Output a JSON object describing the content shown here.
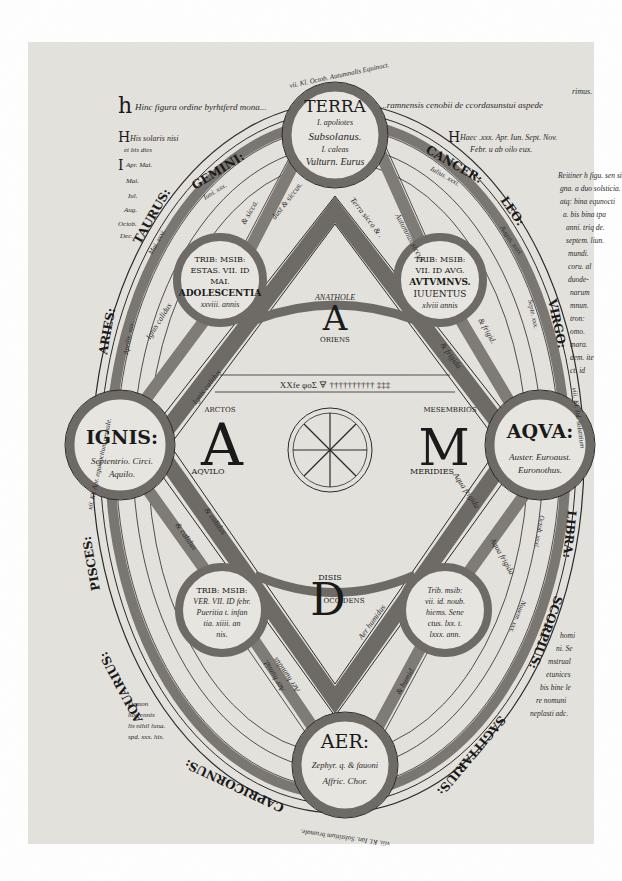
{
  "diagram": {
    "colors": {
      "parchment": "#e4e2dd",
      "ink": "#1a1a1a",
      "band_dark": "#6e6a66",
      "band_mid": "#9a9692",
      "band_light": "#c9c6c1",
      "margin": "#ffffff"
    },
    "header": {
      "line1": "Hinc figura ordine byrhtferd mona...",
      "line1_cont": "...ramnensis cenobii de ccordasunstui aspede",
      "corner_note": "rimus.",
      "right_line": "Haec .xxx. Apr. Iun. Sept. Nov.",
      "right_line2": "Febr. u ab oilo eux.",
      "left_lines": [
        "His solaris nisi",
        "et bis dies",
        "Apr. Mai.",
        "Mai.",
        "Iul.",
        "Aug.",
        "Octob.",
        "Dec."
      ]
    },
    "elements": {
      "terra": {
        "title": "TERRA",
        "lines": [
          "I. apoliotes",
          "Subsolanus.",
          "I. caleas",
          "Vulturn. Eurus"
        ]
      },
      "ignis": {
        "title": "IGNIS:",
        "lines": [
          "Septentrio. Circi.",
          "Aquilo."
        ]
      },
      "aqua": {
        "title": "AQVA:",
        "lines": [
          "Auster. Euroaust.",
          "Euronothus."
        ]
      },
      "aer": {
        "title": "AER:",
        "lines": [
          "Zephyr. q. & fauoni",
          "Affric. Chor."
        ]
      }
    },
    "seasons": {
      "summer": {
        "lines": [
          "TRIB: MSIB:",
          "ESTAS. VII. ID",
          "MAI.",
          "ADOLESCENTIA",
          "xxviii. annis"
        ]
      },
      "autumn": {
        "lines": [
          "TRIB: MSIB:",
          "VII. ID AVG.",
          "AVTVMNVS.",
          "IUUENTUS",
          "xlviii annis"
        ]
      },
      "spring": {
        "lines": [
          "TRIB: MSIB:",
          "VER. VII. ID febr.",
          "Pueritia t. infan",
          "tia. xiiii. an",
          "nis."
        ]
      },
      "winter": {
        "lines": [
          "Trib. msib:",
          "vii. id. noub.",
          "hiems. Sene",
          "ctus. lxx. t.",
          "lxxx. ann."
        ]
      }
    },
    "zodiac": {
      "left": [
        "GEMINI:",
        "TAURUS:",
        "ARIES:",
        "PISCES:",
        "AQUARIUS:",
        "CAPRICORNUS:"
      ],
      "right": [
        "CANCER:",
        "LEO:",
        "VIRGO:",
        "LIBRA:",
        "SCORPIUS:",
        "SAGITTARIUS:"
      ],
      "month_notes": {
        "gemini": [
          "Iuni. xxx.",
          "Iu. xxx."
        ],
        "taurus": [
          "Mai. xxxi.",
          "Iu. xxx."
        ],
        "aries": [
          "Aprilis. xxx.",
          "Iu. xxix."
        ],
        "cancer": [
          "Iulius. xxxi.",
          "Iu. xxix."
        ],
        "leo": [
          "Augus. xxxi.",
          "Iu. xxx."
        ],
        "virgo": [
          "Septe. xxx.",
          "Iu. xxx."
        ],
        "libra": [
          "Octob. xxxi.",
          "Iu. xxix."
        ],
        "scorpius": [
          "Nouem. xxx.",
          "Iu. xxx."
        ]
      },
      "outer_ring_top": "vii. Kl. Octob. Autumnalis Equinoct.",
      "outer_ring_bottom": "viii. Kl. Ian. Solstitium brumale.",
      "outer_ring_left": "xii. Kl. Apr. equinoctium uernale.",
      "outer_ring_right": "viii. Kl. Iul. solstitium"
    },
    "diamond": {
      "top_letter": "A",
      "top_word": "ANATHOLE",
      "top_caption": "ORIENS",
      "left_letter": "A",
      "left_word": "ARCTOS",
      "left_caption": "AQVILO",
      "right_letter": "M",
      "right_word": "MESEMBRIOS",
      "right_caption": "MERIDIES",
      "bottom_letter": "D",
      "bottom_word": "DISIS",
      "bottom_caption": "OCCIDENS",
      "edge_labels": {
        "top_left": "dust & siccus.",
        "top_right": "Terra sicca & .",
        "bottom_left": "Ignis calidus",
        "bottom_right": "Aqua frigida",
        "lower_left": "Aer humidus",
        "lower_right": "Aer humidus",
        "inner_left": "& calidus",
        "inner_right": "& frigida"
      },
      "spoke_labels": {
        "summer_terra": "& sicca.",
        "summer_ignis": "Ignis calidus",
        "autumn_terra": "Autumnus siccus",
        "autumn_aqua": "& frigid.",
        "spring_ignis": "& calidus",
        "spring_aer": "Aer humid.",
        "winter_aqua": "& humid.",
        "winter_aer": "Aqua frigida"
      },
      "cipher_row": "XXfe  φoΣ  🜃  †††††††††† ‡‡‡"
    },
    "right_margin_lines": [
      "Reitiner h figu. sen si",
      "gna. a duo solsticia.",
      "atq: bina equnocti",
      "a. bis bina tpa",
      "anni. triq de.",
      "septem. liun.",
      "mundi.",
      "coru. al",
      "duode-",
      "narum",
      "mnun.",
      "tron:",
      "omo.",
      "mara.",
      "dem. ite",
      "ct. id"
    ],
    "right_margin_lower": [
      "homi",
      "ni. Se",
      "mstrual",
      "etunices",
      "bis bine le",
      "re nomuni",
      "neplasti adc."
    ],
    "left_margin_lower": [
      "Demon",
      "hoc ennis",
      "lis nihil luna.",
      "spd. xxx. his."
    ]
  }
}
